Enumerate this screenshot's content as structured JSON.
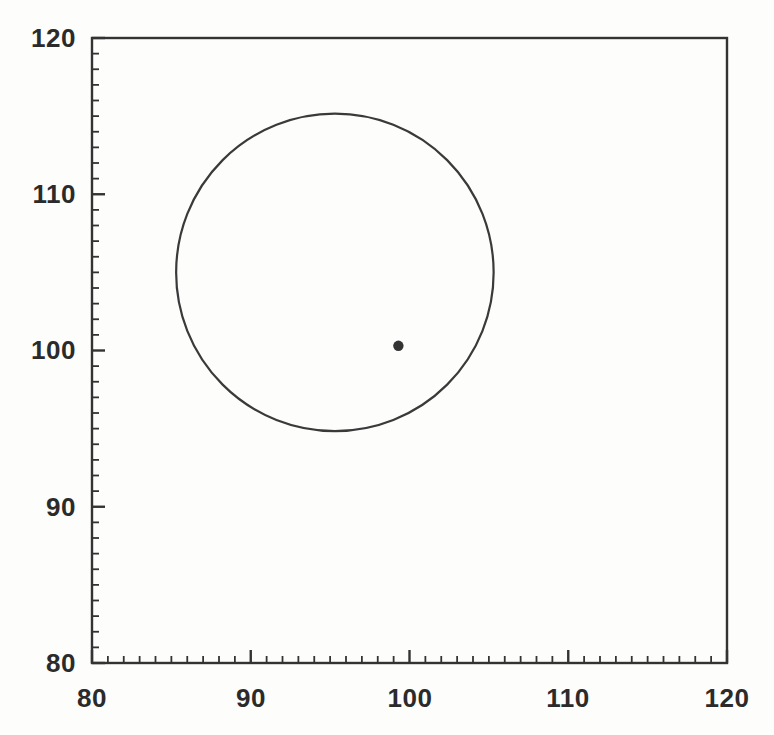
{
  "chart_data": {
    "type": "scatter",
    "title": "",
    "subtitle": "",
    "xlabel": "",
    "ylabel": "",
    "xlim": [
      80,
      120
    ],
    "ylim": [
      80,
      120
    ],
    "grid": false,
    "legend": null,
    "x_major_ticks": [
      80,
      90,
      100,
      110,
      120
    ],
    "y_major_ticks": [
      80,
      90,
      100,
      110,
      120
    ],
    "x_tick_labels": [
      "80",
      "90",
      "100",
      "110",
      "120"
    ],
    "y_tick_labels": [
      "80",
      "90",
      "100",
      "110",
      "120"
    ],
    "minor_tick_interval": 1,
    "series": [
      {
        "name": "data-point",
        "type": "scatter",
        "marker": "filled-circle",
        "color": "#333333",
        "x": [
          99.3
        ],
        "y": [
          100.3
        ]
      },
      {
        "name": "circle-outline",
        "type": "circle",
        "color": "#3a3a3a",
        "center_x": 95.3,
        "center_y": 105.0,
        "radius": 10.0,
        "filled": false
      }
    ]
  },
  "axes": {
    "frame_color": "#333333",
    "tick_color": "#333333",
    "spines": [
      "left",
      "bottom",
      "top",
      "right"
    ]
  }
}
